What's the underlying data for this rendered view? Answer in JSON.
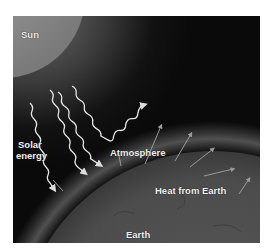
{
  "diagram": {
    "labels": {
      "sun": "Sun",
      "solar_energy_line1": "Solar",
      "solar_energy_line2": "energy",
      "atmosphere": "Atmosphere",
      "heat_from_earth": "Heat from Earth",
      "earth": "Earth"
    },
    "elements": [
      {
        "name": "sun",
        "shape": "circle",
        "position": "top-left"
      },
      {
        "name": "solar-energy-rays",
        "count": 4,
        "style": "wavy arrows",
        "direction": "down-right toward Earth"
      },
      {
        "name": "reflected-ray",
        "count": 1,
        "direction": "up-right away from atmosphere"
      },
      {
        "name": "heat-arrows",
        "count": 6,
        "direction": "outward from Earth surface"
      },
      {
        "name": "atmosphere",
        "shape": "glowing band along Earth's curve"
      },
      {
        "name": "earth",
        "shape": "large circle arc at bottom-right"
      }
    ],
    "colors": {
      "background": "#0b0b0b",
      "sun": "#8a8a8a",
      "earth": "#4a4a4a",
      "atmosphere_glow": "#7a7a7a",
      "ray": "#e6e6e6",
      "text": "#f2f2f2"
    }
  }
}
